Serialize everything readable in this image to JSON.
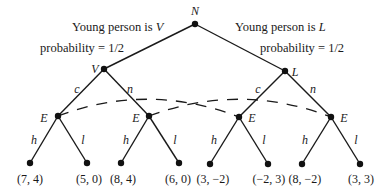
{
  "diagram": {
    "type": "game-tree",
    "root": {
      "label": "N",
      "x": 195,
      "y": 24
    },
    "chance_labels": [
      {
        "text": "Young person is ",
        "var": "V",
        "x": 72,
        "y": 27
      },
      {
        "text": "probability = 1/2",
        "x": 40,
        "y": 51
      },
      {
        "text": "Young person is ",
        "var": "L",
        "x": 235,
        "y": 27
      },
      {
        "text": "probability = 1/2",
        "x": 261,
        "y": 51
      }
    ],
    "types": [
      {
        "label": "V",
        "x": 104,
        "y": 69
      },
      {
        "label": "L",
        "x": 285,
        "y": 71
      }
    ],
    "action_labels_type": [
      {
        "text": "c",
        "x": 75,
        "y": 92
      },
      {
        "text": "n",
        "x": 130,
        "y": 92
      },
      {
        "text": "c",
        "x": 256,
        "y": 93
      },
      {
        "text": "n",
        "x": 313,
        "y": 93
      }
    ],
    "employer_nodes": [
      {
        "label": "E",
        "x": 58,
        "y": 116
      },
      {
        "label": "E",
        "x": 149,
        "y": 116
      },
      {
        "label": "E",
        "x": 239,
        "y": 117
      },
      {
        "label": "E",
        "x": 331,
        "y": 117
      }
    ],
    "action_labels_employer": [
      {
        "text": "h",
        "x": 33,
        "y": 143
      },
      {
        "text": "l",
        "x": 82,
        "y": 143
      },
      {
        "text": "h",
        "x": 125,
        "y": 143
      },
      {
        "text": "l",
        "x": 175,
        "y": 143
      },
      {
        "text": "h",
        "x": 214,
        "y": 143
      },
      {
        "text": "l",
        "x": 264,
        "y": 143
      },
      {
        "text": "h",
        "x": 305,
        "y": 143
      },
      {
        "text": "l",
        "x": 355,
        "y": 143
      }
    ],
    "payoffs": [
      {
        "text": "(7, 4)",
        "x": 30,
        "y": 163
      },
      {
        "text": "(5, 0)",
        "x": 87,
        "y": 163
      },
      {
        "text": "(8, 4)",
        "x": 121,
        "y": 163
      },
      {
        "text": "(6, 0)",
        "x": 179,
        "y": 163
      },
      {
        "text": "(3, −2)",
        "x": 209,
        "y": 164
      },
      {
        "text": "(−2, 3)",
        "x": 268,
        "y": 164
      },
      {
        "text": "(8, −2)",
        "x": 302,
        "y": 164
      },
      {
        "text": "(3, 3)",
        "x": 360,
        "y": 164
      }
    ],
    "information_sets": [
      {
        "from": 0,
        "to": 2,
        "style": "dashed"
      },
      {
        "from": 1,
        "to": 3,
        "style": "dashed"
      }
    ]
  }
}
